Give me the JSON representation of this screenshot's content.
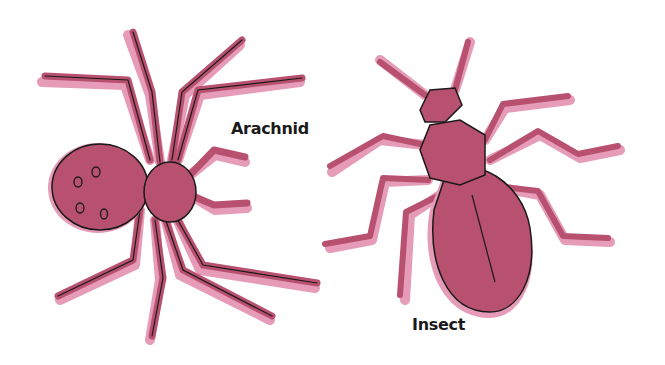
{
  "diagram": {
    "labels": {
      "arachnid": "Arachnid",
      "insect": "Insect"
    },
    "colors": {
      "body_fill": "#b8506f",
      "shadow_fill": "#e69bb8",
      "outline": "#1a1a1a",
      "background": "#ffffff"
    },
    "figures": [
      {
        "name": "spider",
        "label_key": "arachnid",
        "legs": 8,
        "body_parts": 2
      },
      {
        "name": "ant",
        "label_key": "insect",
        "legs": 6,
        "body_parts": 3
      }
    ]
  }
}
